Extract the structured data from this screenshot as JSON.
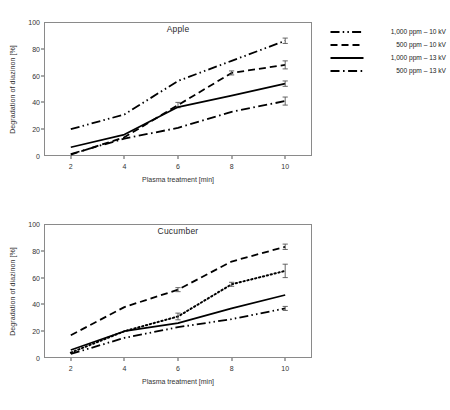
{
  "figure": {
    "panels": [
      {
        "id": "apple",
        "title": "Apple",
        "xlabel": "Plasma treatment [min]",
        "ylabel": "Degradation of diazinon [%]"
      },
      {
        "id": "cucumber",
        "title": "Cucumber",
        "xlabel": "Plasma treatment [min]",
        "ylabel": "Degradation of diazinon [%]"
      }
    ],
    "yticks": [
      0,
      20,
      40,
      60,
      80,
      100
    ],
    "xticks": [
      2,
      4,
      6,
      8,
      10
    ]
  },
  "chart_data": [
    {
      "type": "line",
      "title": "Apple",
      "xlabel": "Plasma treatment [min]",
      "ylabel": "Degradation of diazinon [%]",
      "x": [
        2,
        4,
        6,
        8,
        10
      ],
      "xlim": [
        1,
        11
      ],
      "ylim": [
        0,
        100
      ],
      "grid": false,
      "legend_position": "right",
      "series": [
        {
          "name": "1,000 ppm – 10 kV",
          "linestyle": "dashdotdot",
          "color": "#000000",
          "values": [
            20,
            31,
            56,
            71,
            86
          ],
          "errors": [
            0,
            0,
            0,
            0,
            2
          ]
        },
        {
          "name": "500 ppm – 10 kV",
          "linestyle": "dashed",
          "color": "#000000",
          "values": [
            1,
            14,
            38,
            62,
            68
          ],
          "errors": [
            0,
            0,
            2,
            1.5,
            3
          ]
        },
        {
          "name": "1,000 ppm – 13 kV",
          "linestyle": "solid",
          "color": "#000000",
          "values": [
            6.5,
            16,
            36.5,
            45,
            54
          ],
          "errors": [
            0,
            0,
            0,
            0,
            2
          ]
        },
        {
          "name": "500 ppm – 13 kV",
          "linestyle": "dashdot",
          "color": "#000000",
          "values": [
            1.5,
            13,
            21,
            33,
            41
          ],
          "errors": [
            0,
            0,
            0,
            0,
            3
          ]
        }
      ]
    },
    {
      "type": "line",
      "title": "Cucumber",
      "xlabel": "Plasma treatment [min]",
      "ylabel": "Degradation of diazinon [%]",
      "x": [
        2,
        4,
        6,
        8,
        10
      ],
      "xlim": [
        1,
        11
      ],
      "ylim": [
        0,
        100
      ],
      "grid": false,
      "legend_position": "right",
      "series": [
        {
          "name": "1,000 ppm – 10 kV",
          "linestyle": "dashdotdot",
          "color": "#000000",
          "values": [
            3,
            15,
            23,
            29,
            37
          ],
          "errors": [
            0,
            0,
            0,
            0,
            1.5
          ]
        },
        {
          "name": "500 ppm – 10 kV",
          "linestyle": "dotted",
          "color": "#000000",
          "values": [
            4,
            20,
            31,
            55,
            65
          ],
          "errors": [
            0,
            0,
            2.5,
            1.5,
            5
          ]
        },
        {
          "name": "1,000 ppm – 13 kV",
          "linestyle": "solid",
          "color": "#000000",
          "values": [
            6,
            20,
            26,
            37,
            47
          ],
          "errors": [
            0,
            0,
            0,
            0,
            0
          ]
        },
        {
          "name": "500 ppm – 13 kV",
          "linestyle": "dashed",
          "color": "#000000",
          "values": [
            17,
            38,
            51,
            72,
            83
          ],
          "errors": [
            0,
            0,
            1.5,
            0,
            2
          ]
        }
      ]
    }
  ]
}
